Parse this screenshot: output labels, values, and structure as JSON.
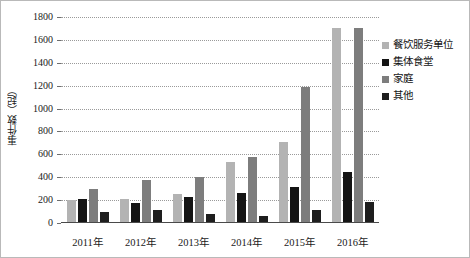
{
  "chart_data": {
    "type": "bar",
    "title": "",
    "subtitle": "",
    "xlabel": "",
    "ylabel": "事件数（起）",
    "categories": [
      "2011年",
      "2012年",
      "2013年",
      "2014年",
      "2015年",
      "2016年"
    ],
    "ylim": [
      0,
      1800
    ],
    "yticks": [
      0,
      200,
      400,
      600,
      800,
      1000,
      1200,
      1400,
      1600,
      1800
    ],
    "ytick_labels": [
      "0",
      "200",
      "400",
      "600",
      "800",
      "1000",
      "1200",
      "1400",
      "1600",
      "1800"
    ],
    "grid": true,
    "grid_style": "dotted",
    "legend_position": "right",
    "series": [
      {
        "name": "餐饮服务单位",
        "color": "#b3b3b3",
        "values": [
          200,
          210,
          253,
          535,
          706,
          1700
        ]
      },
      {
        "name": "集体食堂",
        "color": "#141414",
        "values": [
          214,
          174,
          227,
          260,
          318,
          443
        ]
      },
      {
        "name": "家庭",
        "color": "#7d7d7d",
        "values": [
          296,
          372,
          404,
          578,
          1192,
          1700
        ]
      },
      {
        "name": "其他",
        "color": "#1e1e1e",
        "values": [
          92,
          113,
          78,
          64,
          116,
          182
        ]
      }
    ]
  },
  "legend": {
    "items": [
      {
        "label": "餐饮服务单位",
        "color": "#b3b3b3"
      },
      {
        "label": "集体食堂",
        "color": "#141414"
      },
      {
        "label": "家庭",
        "color": "#7d7d7d"
      },
      {
        "label": "其他",
        "color": "#1e1e1e"
      }
    ]
  }
}
